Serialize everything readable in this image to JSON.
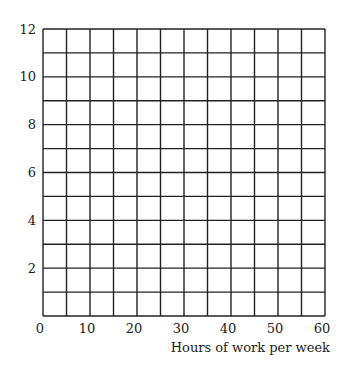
{
  "chart_data": {
    "type": "line",
    "title": "",
    "xlabel": "Hours of work per week",
    "ylabel": "",
    "xlim": [
      0,
      60
    ],
    "ylim": [
      0,
      12
    ],
    "x_ticks": [
      0,
      10,
      20,
      30,
      40,
      50,
      60
    ],
    "y_ticks": [
      2,
      4,
      6,
      8,
      10,
      12
    ],
    "grid": true,
    "grid_x_step": 5,
    "grid_y_step": 1,
    "series": [],
    "legend": null
  },
  "colors": {
    "grid": "#222222",
    "text": "#222222",
    "background": "#ffffff"
  }
}
